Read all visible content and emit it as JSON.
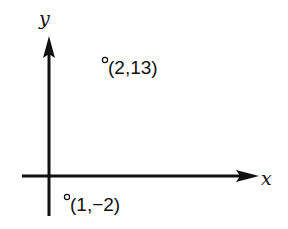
{
  "diagram": {
    "axes": {
      "x_label": "x",
      "y_label": "y"
    },
    "points": [
      {
        "x": 2,
        "y": 13,
        "label": "(2,13)",
        "marker": "open-circle"
      },
      {
        "x": 1,
        "y": -2,
        "label": "(1,−2)",
        "marker": "open-circle"
      }
    ],
    "colors": {
      "ink": "#111111",
      "background": "#ffffff"
    }
  }
}
